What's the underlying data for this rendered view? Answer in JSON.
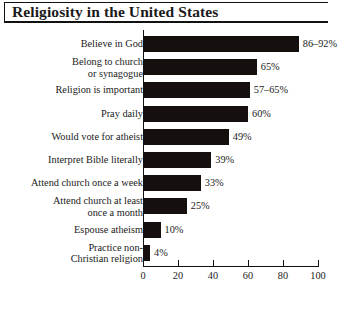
{
  "chart_data": {
    "type": "bar",
    "orientation": "horizontal",
    "title": "Religiosity in the United States",
    "xlabel": "",
    "ylabel": "",
    "xlim": [
      0,
      100
    ],
    "xticks": [
      0,
      20,
      40,
      60,
      80,
      100
    ],
    "grid": false,
    "legend": null,
    "categories": [
      "Believe in God",
      "Belong to church\nor synagogue",
      "Religion is important",
      "Pray daily",
      "Would vote for atheist",
      "Interpret Bible literally",
      "Attend church once a week",
      "Attend church at least\nonce a month",
      "Espouse atheism",
      "Practice non-\nChristian religion"
    ],
    "values": [
      89,
      65,
      61,
      60,
      49,
      39,
      33,
      25,
      10,
      4
    ],
    "value_labels": [
      "86–92%",
      "65%",
      "57–65%",
      "60%",
      "49%",
      "39%",
      "33%",
      "25%",
      "10%",
      "4%"
    ],
    "bar_color": "#15100e"
  },
  "caption": ""
}
